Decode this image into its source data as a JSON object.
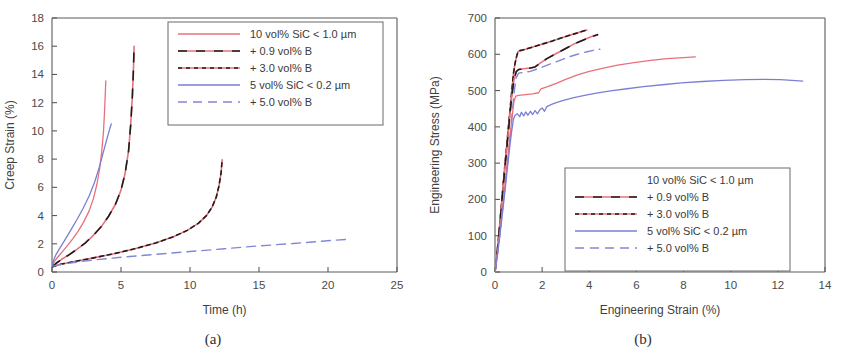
{
  "figure": {
    "panel_a_caption": "(a)",
    "panel_b_caption": "(b)"
  },
  "chart_data": [
    {
      "id": "creep",
      "type": "line",
      "title": "",
      "xlabel": "Time (h)",
      "ylabel": "Creep Strain (%)",
      "xlim": [
        0,
        25
      ],
      "ylim": [
        0,
        18
      ],
      "xticks": [
        0,
        5,
        10,
        15,
        20,
        25
      ],
      "yticks": [
        0,
        2,
        4,
        6,
        8,
        10,
        12,
        14,
        16,
        18
      ],
      "grid": false,
      "legend_position": "top-right",
      "legend": [
        {
          "label": "10 vol% SiC < 1.0 µm",
          "style": "solid-red",
          "color": "#e8707a"
        },
        {
          "label": "+ 0.9 vol% B",
          "style": "red-black-dash",
          "color": "#e8707a"
        },
        {
          "label": "+ 3.0 vol% B",
          "style": "red-black-dot",
          "color": "#e8707a"
        },
        {
          "label": "5 vol% SiC < 0.2 µm",
          "style": "solid-blue",
          "color": "#7b7fd4"
        },
        {
          "label": "+ 5.0 vol% B",
          "style": "blue-dashed",
          "color": "#7b7fd4"
        }
      ],
      "series": [
        {
          "name": "10 vol% SiC < 1.0 µm",
          "style": "solid-red",
          "color": "#e8707a",
          "points": [
            [
              0.02,
              0.45
            ],
            [
              0.1,
              0.62
            ],
            [
              0.25,
              0.85
            ],
            [
              0.5,
              1.15
            ],
            [
              0.8,
              1.5
            ],
            [
              1.1,
              1.85
            ],
            [
              1.5,
              2.35
            ],
            [
              1.9,
              2.9
            ],
            [
              2.3,
              3.55
            ],
            [
              2.7,
              4.35
            ],
            [
              3.0,
              5.2
            ],
            [
              3.25,
              6.2
            ],
            [
              3.45,
              7.3
            ],
            [
              3.6,
              8.5
            ],
            [
              3.72,
              9.8
            ],
            [
              3.8,
              11.2
            ],
            [
              3.86,
              12.6
            ],
            [
              3.9,
              13.55
            ]
          ]
        },
        {
          "name": "+ 0.9 vol% B (short)",
          "style": "red-black-dash",
          "color": "#e8707a",
          "points": [
            [
              0.03,
              0.4
            ],
            [
              0.3,
              0.62
            ],
            [
              0.7,
              0.9
            ],
            [
              1.2,
              1.2
            ],
            [
              1.8,
              1.6
            ],
            [
              2.4,
              2.05
            ],
            [
              3.0,
              2.6
            ],
            [
              3.6,
              3.25
            ],
            [
              4.1,
              3.95
            ],
            [
              4.6,
              4.8
            ],
            [
              5.0,
              5.8
            ],
            [
              5.3,
              7.0
            ],
            [
              5.55,
              8.6
            ],
            [
              5.7,
              10.4
            ],
            [
              5.82,
              12.4
            ],
            [
              5.9,
              14.3
            ],
            [
              5.95,
              16.0
            ]
          ]
        },
        {
          "name": "+ 3.0 vol% B (long)",
          "style": "red-black-dot",
          "color": "#e8707a",
          "points": [
            [
              0.05,
              0.38
            ],
            [
              0.5,
              0.52
            ],
            [
              1.5,
              0.72
            ],
            [
              3.0,
              1.0
            ],
            [
              4.5,
              1.3
            ],
            [
              6.0,
              1.65
            ],
            [
              7.5,
              2.05
            ],
            [
              8.8,
              2.5
            ],
            [
              9.8,
              2.95
            ],
            [
              10.6,
              3.45
            ],
            [
              11.2,
              4.0
            ],
            [
              11.6,
              4.6
            ],
            [
              11.9,
              5.3
            ],
            [
              12.1,
              6.1
            ],
            [
              12.25,
              7.0
            ],
            [
              12.33,
              7.95
            ]
          ]
        },
        {
          "name": "5 vol% SiC < 0.2 µm",
          "style": "solid-blue",
          "color": "#7b7fd4",
          "points": [
            [
              0.02,
              0.5
            ],
            [
              0.12,
              0.85
            ],
            [
              0.3,
              1.25
            ],
            [
              0.6,
              1.75
            ],
            [
              0.95,
              2.3
            ],
            [
              1.35,
              2.95
            ],
            [
              1.8,
              3.7
            ],
            [
              2.25,
              4.5
            ],
            [
              2.7,
              5.4
            ],
            [
              3.1,
              6.4
            ],
            [
              3.45,
              7.5
            ],
            [
              3.75,
              8.6
            ],
            [
              4.0,
              9.5
            ],
            [
              4.2,
              10.2
            ],
            [
              4.3,
              10.5
            ]
          ]
        },
        {
          "name": "+ 5.0 vol% B",
          "style": "blue-dashed",
          "color": "#7b7fd4",
          "points": [
            [
              0.05,
              0.42
            ],
            [
              1.0,
              0.6
            ],
            [
              3.0,
              0.85
            ],
            [
              5.0,
              1.05
            ],
            [
              7.5,
              1.25
            ],
            [
              10.0,
              1.45
            ],
            [
              12.5,
              1.65
            ],
            [
              15.0,
              1.85
            ],
            [
              17.5,
              2.02
            ],
            [
              19.5,
              2.18
            ],
            [
              21.5,
              2.32
            ]
          ]
        }
      ]
    },
    {
      "id": "tensile",
      "type": "line",
      "title": "",
      "xlabel": "Engineering Strain (%)",
      "ylabel": "Engineering Stress (MPa)",
      "xlim": [
        0,
        14
      ],
      "ylim": [
        0,
        700
      ],
      "xticks": [
        0,
        2,
        4,
        6,
        8,
        10,
        12,
        14
      ],
      "yticks": [
        0,
        100,
        200,
        300,
        400,
        500,
        600,
        700
      ],
      "grid": false,
      "legend_position": "center-right",
      "legend": [
        {
          "label": "10 vol% SiC < 1.0 µm",
          "style": "none",
          "color": "#e8707a"
        },
        {
          "label": "+ 0.9 vol% B",
          "style": "red-black-dash",
          "color": "#e8707a"
        },
        {
          "label": "+ 3.0 vol% B",
          "style": "red-black-dot",
          "color": "#e8707a"
        },
        {
          "label": "5 vol% SiC < 0.2 µm",
          "style": "solid-blue",
          "color": "#7b7fd4"
        },
        {
          "label": "+ 5.0 vol% B",
          "style": "blue-dashed",
          "color": "#7b7fd4"
        }
      ],
      "series": [
        {
          "name": "+ 3.0 vol% B",
          "style": "red-black-dot",
          "color": "#e8707a",
          "points": [
            [
              0.0,
              0
            ],
            [
              0.1,
              60
            ],
            [
              0.2,
              130
            ],
            [
              0.3,
              205
            ],
            [
              0.4,
              280
            ],
            [
              0.5,
              350
            ],
            [
              0.6,
              420
            ],
            [
              0.7,
              490
            ],
            [
              0.78,
              545
            ],
            [
              0.85,
              575
            ],
            [
              0.92,
              595
            ],
            [
              0.98,
              608
            ],
            [
              1.05,
              610
            ],
            [
              1.3,
              614
            ],
            [
              1.6,
              620
            ],
            [
              2.0,
              628
            ],
            [
              2.4,
              636
            ],
            [
              2.8,
              645
            ],
            [
              3.2,
              653
            ],
            [
              3.5,
              659
            ],
            [
              3.75,
              664
            ],
            [
              3.9,
              667
            ]
          ]
        },
        {
          "name": "+ 0.9 vol% B",
          "style": "red-black-dash",
          "color": "#e8707a",
          "points": [
            [
              0.0,
              0
            ],
            [
              0.1,
              58
            ],
            [
              0.2,
              126
            ],
            [
              0.3,
              200
            ],
            [
              0.4,
              272
            ],
            [
              0.5,
              342
            ],
            [
              0.6,
              410
            ],
            [
              0.7,
              478
            ],
            [
              0.8,
              528
            ],
            [
              0.9,
              552
            ],
            [
              1.0,
              558
            ],
            [
              1.2,
              560
            ],
            [
              1.5,
              562
            ],
            [
              1.7,
              565
            ],
            [
              1.9,
              575
            ],
            [
              2.2,
              588
            ],
            [
              2.6,
              602
            ],
            [
              3.0,
              616
            ],
            [
              3.4,
              630
            ],
            [
              3.8,
              641
            ],
            [
              4.1,
              649
            ],
            [
              4.35,
              654
            ]
          ]
        },
        {
          "name": "+ 5.0 vol% B",
          "style": "blue-dashed",
          "color": "#7b7fd4",
          "points": [
            [
              0.0,
              0
            ],
            [
              0.15,
              70
            ],
            [
              0.3,
              160
            ],
            [
              0.45,
              250
            ],
            [
              0.6,
              345
            ],
            [
              0.72,
              430
            ],
            [
              0.82,
              500
            ],
            [
              0.9,
              535
            ],
            [
              1.0,
              548
            ],
            [
              1.2,
              550
            ],
            [
              1.5,
              553
            ],
            [
              1.9,
              562
            ],
            [
              2.3,
              572
            ],
            [
              2.7,
              582
            ],
            [
              3.1,
              592
            ],
            [
              3.5,
              600
            ],
            [
              3.9,
              607
            ],
            [
              4.25,
              612
            ],
            [
              4.45,
              614
            ]
          ]
        },
        {
          "name": "10 vol% SiC < 1.0 µm",
          "style": "solid-red",
          "color": "#e8707a",
          "points": [
            [
              0.0,
              0
            ],
            [
              0.12,
              60
            ],
            [
              0.25,
              135
            ],
            [
              0.38,
              212
            ],
            [
              0.5,
              288
            ],
            [
              0.62,
              362
            ],
            [
              0.72,
              425
            ],
            [
              0.8,
              468
            ],
            [
              0.88,
              485
            ],
            [
              1.0,
              487
            ],
            [
              1.3,
              489
            ],
            [
              1.6,
              491
            ],
            [
              1.85,
              494
            ],
            [
              1.95,
              505
            ],
            [
              2.2,
              510
            ],
            [
              2.6,
              520
            ],
            [
              3.0,
              531
            ],
            [
              3.5,
              543
            ],
            [
              4.0,
              553
            ],
            [
              4.6,
              562
            ],
            [
              5.2,
              570
            ],
            [
              5.9,
              577
            ],
            [
              6.6,
              583
            ],
            [
              7.3,
              588
            ],
            [
              8.0,
              591
            ],
            [
              8.5,
              593
            ]
          ]
        },
        {
          "name": "5 vol% SiC < 0.2 µm",
          "style": "solid-blue",
          "color": "#7b7fd4",
          "points": [
            [
              0.0,
              0
            ],
            [
              0.12,
              55
            ],
            [
              0.25,
              125
            ],
            [
              0.38,
              198
            ],
            [
              0.5,
              270
            ],
            [
              0.6,
              330
            ],
            [
              0.7,
              385
            ],
            [
              0.78,
              420
            ],
            [
              0.85,
              432
            ],
            [
              0.95,
              436
            ],
            [
              1.05,
              428
            ],
            [
              1.12,
              440
            ],
            [
              1.22,
              430
            ],
            [
              1.3,
              441
            ],
            [
              1.4,
              432
            ],
            [
              1.5,
              443
            ],
            [
              1.6,
              434
            ],
            [
              1.7,
              445
            ],
            [
              1.8,
              436
            ],
            [
              1.9,
              447
            ],
            [
              2.0,
              452
            ],
            [
              2.1,
              443
            ],
            [
              2.2,
              456
            ],
            [
              2.4,
              462
            ],
            [
              2.6,
              467
            ],
            [
              2.9,
              473
            ],
            [
              3.3,
              480
            ],
            [
              3.8,
              487
            ],
            [
              4.3,
              493
            ],
            [
              4.9,
              499
            ],
            [
              5.6,
              505
            ],
            [
              6.3,
              511
            ],
            [
              7.1,
              516
            ],
            [
              7.9,
              521
            ],
            [
              8.8,
              525
            ],
            [
              9.7,
              528
            ],
            [
              10.6,
              530
            ],
            [
              11.4,
              531
            ],
            [
              12.1,
              530
            ],
            [
              12.6,
              528
            ],
            [
              13.05,
              526
            ]
          ]
        }
      ]
    }
  ]
}
